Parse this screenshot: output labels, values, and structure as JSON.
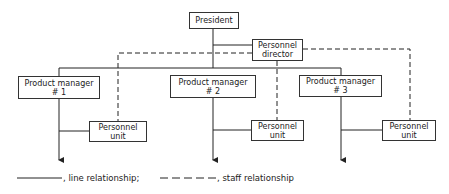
{
  "chart": {
    "president": {
      "label": "President"
    },
    "personnel_director": {
      "line1": "Personnel",
      "line2": "director"
    },
    "product_managers": [
      {
        "line1": "Product manager",
        "line2": "# 1"
      },
      {
        "line1": "Product manager",
        "line2": "# 2"
      },
      {
        "line1": "Product manager",
        "line2": "# 3"
      }
    ],
    "personnel_units": [
      {
        "line1": "Personnel",
        "line2": "unit"
      },
      {
        "line1": "Personnel",
        "line2": "unit"
      },
      {
        "line1": "Personnel",
        "line2": "unit"
      }
    ]
  },
  "legend": {
    "line_label": ", line relationship;",
    "staff_label": ", staff relationship"
  },
  "colors": {
    "line": "#222222",
    "background": "#ffffff"
  }
}
